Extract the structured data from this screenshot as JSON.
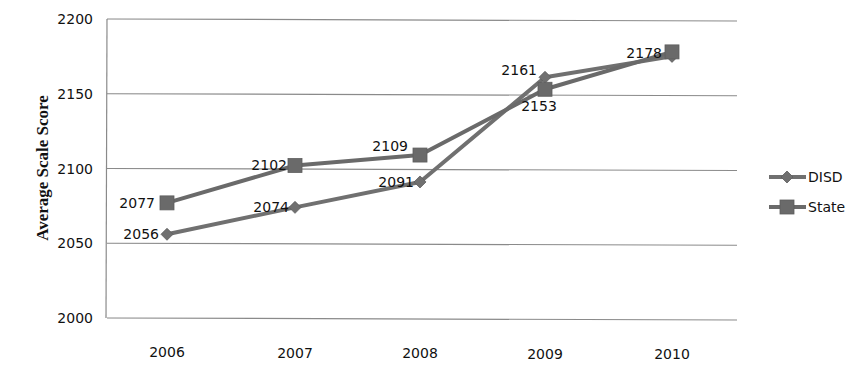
{
  "chart_data": {
    "type": "line",
    "title": "",
    "xlabel": "",
    "ylabel": "Average Scale Score",
    "categories": [
      "2006",
      "2007",
      "2008",
      "2009",
      "2010"
    ],
    "ylim": [
      2000,
      2200
    ],
    "yticks": [
      "2000",
      "2050",
      "2100",
      "2150",
      "2200"
    ],
    "grid": true,
    "legend_position": "right",
    "series": [
      {
        "name": "DISD",
        "marker": "diamond",
        "color": "#707070",
        "values": [
          2056,
          2074,
          2091,
          2161,
          2175
        ],
        "labels": [
          "2056",
          "2074",
          "2091",
          "2161",
          ""
        ]
      },
      {
        "name": "State",
        "marker": "square",
        "color": "#6a6a6a",
        "values": [
          2077,
          2102,
          2109,
          2153,
          2178
        ],
        "labels": [
          "2077",
          "2102",
          "2109",
          "2153",
          "2178"
        ]
      }
    ]
  }
}
